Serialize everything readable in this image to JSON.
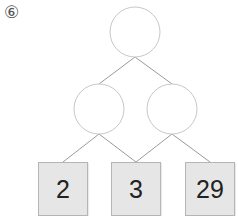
{
  "problem_label": "⑥",
  "tree": {
    "root": {
      "value": ""
    },
    "middle": [
      {
        "value": ""
      },
      {
        "value": ""
      }
    ],
    "leaves": [
      {
        "value": "2"
      },
      {
        "value": "3"
      },
      {
        "value": "29"
      }
    ]
  },
  "colors": {
    "line": "#9a9a9a",
    "box_fill": "#e6e6e6",
    "box_border": "#b5b5b5",
    "circle_border": "#c8c8c8"
  }
}
